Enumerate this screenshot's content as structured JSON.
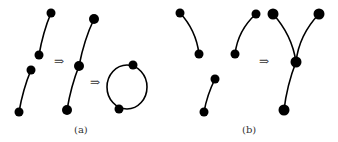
{
  "figure": {
    "panels": [
      {
        "id": "a",
        "caption": "(a)",
        "arrows": [
          "⇒",
          "⇒"
        ],
        "description": "Two disjoint paths merge into one path, then into a cycle"
      },
      {
        "id": "b",
        "caption": "(b)",
        "arrows": [
          "⇒"
        ],
        "description": "Three paths merge into a Y-shaped tree"
      }
    ]
  }
}
